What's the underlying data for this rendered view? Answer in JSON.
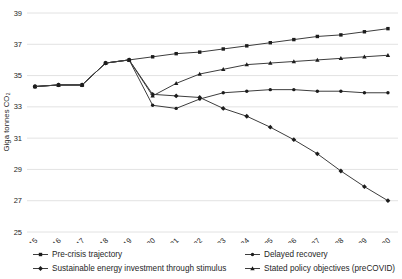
{
  "chart_data": {
    "type": "line",
    "title": "",
    "xlabel": "",
    "ylabel": "Giga tonnes CO₂",
    "ylim": [
      25,
      39
    ],
    "yticks": [
      39,
      37,
      35,
      33,
      31,
      29,
      27,
      25
    ],
    "grid": "horizontal",
    "legend_position": "bottom",
    "x": [
      "2015",
      "2016",
      "2017",
      "2018",
      "2019",
      "2020",
      "2021",
      "2022",
      "2023",
      "2024",
      "2025",
      "2026",
      "2027",
      "2028",
      "2029",
      "2030"
    ],
    "series": [
      {
        "name": "Pre-crisis trajectory",
        "marker": "square",
        "values": [
          34.3,
          34.4,
          34.4,
          35.8,
          36.0,
          36.2,
          36.4,
          36.5,
          36.7,
          36.9,
          37.1,
          37.3,
          37.5,
          37.6,
          37.8,
          38.0
        ]
      },
      {
        "name": "Sustainable energy investment through stimulus",
        "marker": "diamond",
        "values": [
          34.3,
          34.4,
          34.4,
          35.8,
          36.0,
          33.8,
          33.7,
          33.6,
          32.9,
          32.4,
          31.7,
          30.9,
          30.0,
          28.9,
          27.9,
          27.0
        ]
      },
      {
        "name": "Delayed recovery",
        "marker": "circle",
        "values": [
          34.3,
          34.4,
          34.4,
          35.8,
          36.0,
          33.1,
          32.9,
          33.5,
          33.9,
          34.0,
          34.1,
          34.1,
          34.0,
          34.0,
          33.9,
          33.9
        ]
      },
      {
        "name": "Stated policy objectives (preCOVID)",
        "marker": "triangle",
        "values": [
          34.3,
          34.4,
          34.4,
          35.8,
          36.0,
          33.7,
          34.5,
          35.1,
          35.4,
          35.7,
          35.8,
          35.9,
          36.0,
          36.1,
          36.2,
          36.3
        ]
      }
    ],
    "colors": {
      "line": "#3d3d3d",
      "marker": "#1c1c1c",
      "grid": "#dadada",
      "text": "#262626",
      "background": "#ffffff"
    }
  }
}
